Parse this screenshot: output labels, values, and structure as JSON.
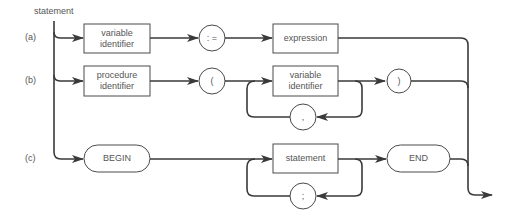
{
  "diagram": {
    "title": "statement",
    "rows": [
      {
        "label": "(a)",
        "nodes": [
          {
            "type": "nonterminal",
            "text": "variable identifier"
          },
          {
            "type": "terminal",
            "text": ":="
          },
          {
            "type": "nonterminal",
            "text": "expression"
          }
        ]
      },
      {
        "label": "(b)",
        "nodes": [
          {
            "type": "nonterminal",
            "text": "procedure identifier"
          },
          {
            "type": "terminal",
            "text": "("
          },
          {
            "type": "nonterminal",
            "text": "variable identifier",
            "loop_separator": ","
          },
          {
            "type": "terminal",
            "text": ")"
          }
        ]
      },
      {
        "label": "(c)",
        "nodes": [
          {
            "type": "keyword",
            "text": "BEGIN"
          },
          {
            "type": "nonterminal",
            "text": "statement",
            "loop_separator": ";"
          },
          {
            "type": "keyword",
            "text": "END"
          }
        ]
      }
    ]
  },
  "labels": {
    "title": "statement",
    "row_a": "(a)",
    "row_b": "(b)",
    "row_c": "(c)",
    "a_var_id_line1": "variable",
    "a_var_id_line2": "identifier",
    "a_assign": ": =",
    "a_expression": "expression",
    "b_proc_line1": "procedure",
    "b_proc_line2": "identifier",
    "b_lparen": "(",
    "b_var_line1": "variable",
    "b_var_line2": "identifier",
    "b_comma": ",",
    "b_rparen": ")",
    "c_begin": "BEGIN",
    "c_statement": "statement",
    "c_semicolon": ";",
    "c_end": "END"
  },
  "colors": {
    "line": "#3a3a3a",
    "text": "#555555",
    "background": "#ffffff"
  }
}
